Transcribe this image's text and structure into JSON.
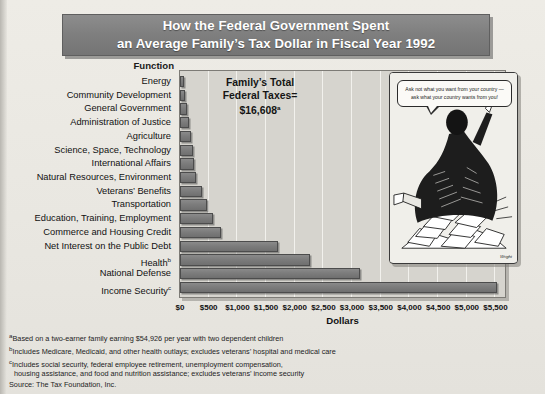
{
  "title": {
    "line1": "How the Federal Government Spent",
    "line2": "an Average Family’s Tax Dollar in Fiscal Year 1992"
  },
  "axis": {
    "function_header": "Function",
    "xlabel": "Dollars",
    "ticks": [
      "$0",
      "$500",
      "$1,000",
      "$1,500",
      "$2,000",
      "$2,500",
      "$3,000",
      "$3,500",
      "$4,000",
      "$4,500",
      "$5,000",
      "$5,500"
    ]
  },
  "annotation": {
    "line1": "Family’s Total",
    "line2": "Federal Taxes=",
    "line3": "$16,608",
    "line3_sup": "a"
  },
  "cartoon": {
    "speech": "Ask not what you want from your country — ask what your country wants from you!",
    "signature": "Wright"
  },
  "footnotes": {
    "a": "Based on a two-earner family earning $54,926 per year with two dependent children",
    "b": "Includes Medicare, Medicaid, and other health outlays; excludes veterans’ hospital and medical care",
    "c1": "Includes social security, federal employee retirement, unemployment compensation,",
    "c2": "housing assistance, and food and nutrition assistance; excludes veterans’ income security",
    "source": "Source: The Tax Foundation, Inc."
  },
  "colors": {
    "banner": "#7e7e7e",
    "bar": "#7c7c7c",
    "plot_background": "#d6d4ce",
    "page_background": "#eceae4"
  },
  "chart_data": {
    "type": "bar",
    "orientation": "horizontal",
    "title": "How the Federal Government Spent an Average Family’s Tax Dollar in Fiscal Year 1992",
    "xlabel": "Dollars",
    "ylabel": "Function",
    "xlim": [
      0,
      5650
    ],
    "grid": true,
    "legend": "none",
    "total_label": "Family’s Total Federal Taxes= $16,608",
    "categories": [
      "Energy",
      "Community Development",
      "General Government",
      "Administration of Justice",
      "Agriculture",
      "Science, Space, Technology",
      "International Affairs",
      "Natural Resources, Environment",
      "Veterans’ Benefits",
      "Transportation",
      "Education, Training, Employment",
      "Commerce and Housing Credit",
      "Net Interest on the Public Debt",
      "Health",
      "National Defense",
      "Income Security"
    ],
    "category_footnotes": [
      "",
      "",
      "",
      "",
      "",
      "",
      "",
      "",
      "",
      "",
      "",
      "",
      "",
      "b",
      "",
      "c"
    ],
    "values": [
      70,
      95,
      125,
      155,
      190,
      225,
      250,
      285,
      385,
      470,
      570,
      710,
      1700,
      2270,
      3140,
      5520
    ]
  }
}
